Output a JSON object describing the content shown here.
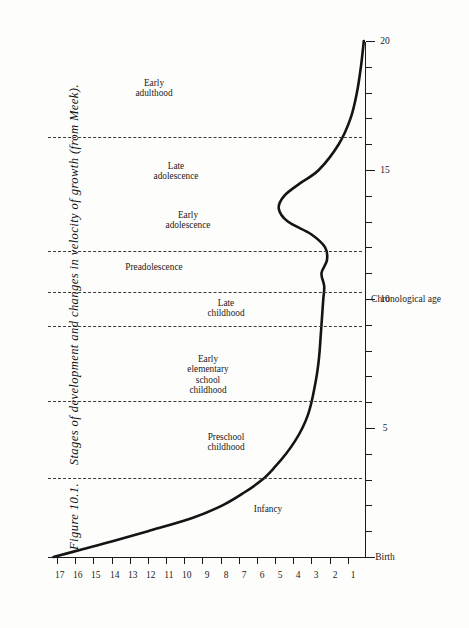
{
  "figure": {
    "number_label": "Figure 10.1.",
    "caption_text": "Stages of development and changes in velocity of growth (from Meek).",
    "caption_full": "Figure 10.1.   Stages of development and changes in velocity of growth (from Meek).",
    "source_attribution": "(from Meek)",
    "orientation": "rotated-90-ccw",
    "page_background": "#fdfdfc",
    "ink_color": "#1a1a1a"
  },
  "chart_data": {
    "type": "line",
    "title": "Stages of development and changes in velocity of growth",
    "xlabel": "Chronological age",
    "ylabel": "Velocity of growth",
    "xlim": [
      0,
      20
    ],
    "ylim": [
      0,
      17.5
    ],
    "grid": false,
    "legend": "none",
    "x_origin_label": "Birth",
    "x_tick_values": [
      0,
      1,
      2,
      3,
      4,
      5,
      6,
      7,
      8,
      9,
      10,
      11,
      12,
      13,
      14,
      15,
      16,
      17,
      18,
      19,
      20
    ],
    "x_labeled_ticks": [
      {
        "value": 0,
        "label": "Birth"
      },
      {
        "value": 5,
        "label": "5"
      },
      {
        "value": 10,
        "label": "10"
      },
      {
        "value": 15,
        "label": "15"
      },
      {
        "value": 20,
        "label": "20"
      }
    ],
    "y_tick_values": [
      1,
      2,
      3,
      4,
      5,
      6,
      7,
      8,
      9,
      10,
      11,
      12,
      13,
      14,
      15,
      16,
      17
    ],
    "y_tick_labels": [
      "1",
      "2",
      "3",
      "4",
      "5",
      "6",
      "7",
      "8",
      "9",
      "10",
      "11",
      "12",
      "13",
      "14",
      "15",
      "16",
      "17"
    ],
    "series": [
      {
        "name": "Velocity of growth",
        "style": "solid",
        "color": "#141414",
        "x": [
          0,
          0.3,
          0.6,
          1.0,
          1.5,
          2.0,
          2.5,
          3.0,
          3.5,
          4.0,
          4.5,
          5.0,
          5.5,
          6.0,
          6.5,
          7.0,
          7.5,
          8.0,
          8.5,
          9.0,
          9.5,
          10.0,
          10.5,
          11.0,
          11.5,
          12.0,
          12.5,
          13.0,
          13.5,
          14.0,
          14.5,
          15.0,
          16.0,
          17.0,
          18.0,
          19.0,
          20.0
        ],
        "y": [
          17.2,
          15.6,
          14.0,
          12.0,
          9.6,
          7.9,
          6.7,
          5.7,
          5.0,
          4.4,
          3.9,
          3.5,
          3.2,
          3.0,
          2.85,
          2.72,
          2.62,
          2.55,
          2.5,
          2.45,
          2.4,
          2.35,
          2.3,
          2.45,
          2.15,
          2.25,
          3.0,
          4.3,
          4.8,
          4.5,
          3.6,
          2.6,
          1.5,
          0.85,
          0.5,
          0.28,
          0.12
        ]
      }
    ],
    "stage_separators_at_age": [
      3.1,
      6.1,
      9.0,
      10.3,
      11.9,
      16.3
    ],
    "stages": [
      {
        "label": "Infancy",
        "lines": [
          "Infancy"
        ],
        "age_center": 1.7
      },
      {
        "label": "Preschool childhood",
        "lines": [
          "Preschool",
          "childhood"
        ],
        "age_center": 4.5
      },
      {
        "label": "Early elementary school childhood",
        "lines": [
          "Early",
          "elementary",
          "school",
          "childhood"
        ],
        "age_center": 7.5
      },
      {
        "label": "Late childhood",
        "lines": [
          "Late",
          "childhood"
        ],
        "age_center": 9.7
      },
      {
        "label": "Preadolescence",
        "lines": [
          "Preadolescence"
        ],
        "age_center": 11.1
      },
      {
        "label": "Early adolescence",
        "lines": [
          "Early",
          "adolescence"
        ],
        "age_center": 13.1
      },
      {
        "label": "Late adolescence",
        "lines": [
          "Late",
          "adolescence"
        ],
        "age_center": 15.0
      },
      {
        "label": "Early adulthood",
        "lines": [
          "Early",
          "adulthood"
        ],
        "age_center": 18.2
      }
    ]
  }
}
